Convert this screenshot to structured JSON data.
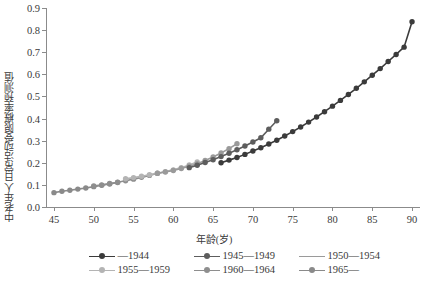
{
  "chart_data": {
    "type": "line",
    "title": "",
    "xlabel": "年龄(岁)",
    "ylabel": "中老年人日常活动受限概率预测值",
    "xlim": [
      44,
      91
    ],
    "ylim": [
      0.0,
      0.9
    ],
    "xticks": [
      45,
      50,
      55,
      60,
      65,
      70,
      75,
      80,
      85,
      90
    ],
    "xtick_labels": [
      "45",
      "50",
      "55",
      "60",
      "65",
      "70",
      "75",
      "80",
      "85",
      "90"
    ],
    "yticks": [
      0.0,
      0.1,
      0.2,
      0.3,
      0.4,
      0.5,
      0.6,
      0.7,
      0.8,
      0.9
    ],
    "ytick_labels": [
      "0.0",
      "0.1",
      "0.2",
      "0.3",
      "0.4",
      "0.5",
      "0.6",
      "0.7",
      "0.8",
      "0.9"
    ],
    "grid": false,
    "legend_position": "bottom",
    "marker": "circle",
    "series": [
      {
        "name": "—1944",
        "color": "#3b3b3b",
        "x": [
          66,
          67,
          68,
          69,
          70,
          71,
          72,
          73,
          74,
          75,
          76,
          77,
          78,
          79,
          80,
          81,
          82,
          83,
          84,
          85,
          86,
          87,
          88,
          89,
          90
        ],
        "values": [
          0.2,
          0.212,
          0.224,
          0.238,
          0.253,
          0.268,
          0.285,
          0.302,
          0.321,
          0.341,
          0.362,
          0.384,
          0.407,
          0.431,
          0.456,
          0.482,
          0.509,
          0.537,
          0.566,
          0.596,
          0.626,
          0.658,
          0.69,
          0.723,
          0.838
        ]
      },
      {
        "name": "1945—1949",
        "color": "#5d5d5d",
        "x": [
          62,
          63,
          64,
          65,
          66,
          67,
          68,
          69,
          70,
          71,
          72,
          73
        ],
        "values": [
          0.178,
          0.189,
          0.201,
          0.214,
          0.228,
          0.243,
          0.259,
          0.276,
          0.294,
          0.313,
          0.352,
          0.39
        ]
      },
      {
        "name": "1950—1954",
        "color": "#9a9a9a",
        "x": [
          58,
          59,
          60,
          61,
          62,
          63,
          64,
          65,
          66,
          67,
          68
        ],
        "values": [
          0.152,
          0.158,
          0.165,
          0.174,
          0.184,
          0.196,
          0.21,
          0.226,
          0.244,
          0.264,
          0.286
        ]
      },
      {
        "name": "1955—1959",
        "color": "#b4b4b4",
        "x": [
          54,
          55,
          56,
          57,
          58,
          59,
          60,
          61,
          62,
          63
        ],
        "values": [
          0.128,
          0.133,
          0.139,
          0.146,
          0.153,
          0.16,
          0.168,
          0.178,
          0.19,
          0.204
        ]
      },
      {
        "name": "1960—1964",
        "color": "#8e8e8e",
        "x": [
          50,
          51,
          52,
          53,
          54,
          55,
          56,
          57,
          58
        ],
        "values": [
          0.095,
          0.1,
          0.106,
          0.112,
          0.119,
          0.126,
          0.134,
          0.143,
          0.153
        ]
      },
      {
        "name": "1965—",
        "color": "#8a8a8a",
        "x": [
          45,
          46,
          47,
          48,
          49,
          50,
          51,
          52,
          53
        ],
        "values": [
          0.065,
          0.071,
          0.076,
          0.081,
          0.086,
          0.092,
          0.098,
          0.104,
          0.111
        ]
      }
    ]
  },
  "legend": {
    "items": [
      {
        "label": "—1944",
        "color": "#3b3b3b",
        "show_marker": true
      },
      {
        "label": "1945—1949",
        "color": "#5d5d5d",
        "show_marker": true
      },
      {
        "label": "1950—1954",
        "color": "#9a9a9a",
        "show_marker": false
      },
      {
        "label": "1955—1959",
        "color": "#b4b4b4",
        "show_marker": true
      },
      {
        "label": "1960—1964",
        "color": "#8e8e8e",
        "show_marker": true
      },
      {
        "label": "1965—",
        "color": "#8a8a8a",
        "show_marker": true
      }
    ]
  }
}
